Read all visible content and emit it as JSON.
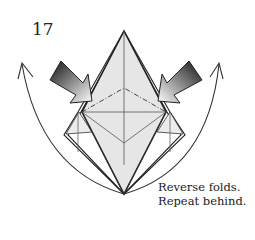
{
  "step": {
    "number": "17",
    "instructions": [
      "Reverse folds.",
      "Repeat behind."
    ]
  },
  "diagram": {
    "paper_fill": "#e6e6e6",
    "line_color": "#222222",
    "arrows": [
      {
        "name": "push-arrow-left",
        "type": "push",
        "direction": "inward"
      },
      {
        "name": "push-arrow-right",
        "type": "push",
        "direction": "inward"
      },
      {
        "name": "swing-arrow-left",
        "type": "curved",
        "direction": "up"
      },
      {
        "name": "swing-arrow-right",
        "type": "curved",
        "direction": "up"
      }
    ],
    "fold_lines": [
      "valley-fold-dashed",
      "mountain-fold-dash-dot"
    ]
  }
}
